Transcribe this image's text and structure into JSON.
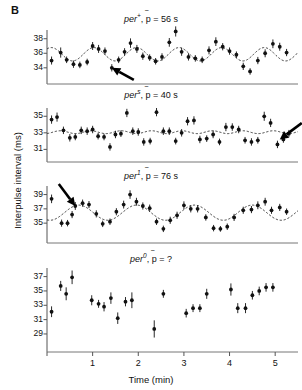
{
  "panel_letter": "B",
  "axes": {
    "ylabel": "Interpulse interval (ms)",
    "xlabel": "Time (min)",
    "xticks": [
      1,
      2,
      3,
      4,
      5
    ],
    "xlim": [
      0,
      5.5
    ]
  },
  "chart_data": {
    "type": "scatter",
    "xlabel": "Time (min)",
    "ylabel": "Interpulse interval (ms)",
    "xlim": [
      0,
      5.5
    ],
    "grid": false,
    "legend": "none",
    "error_bars": "vertical SEM bars on every point",
    "panels": [
      {
        "id": "per-plus",
        "genotype": "per",
        "superscript": "+",
        "period_label": "p̄ = 56 s",
        "period_seconds": 56,
        "title_text": "per+, p̄ = 56 s",
        "fit_curve": "dashed sinusoid",
        "ylim": [
          32.6,
          39.2
        ],
        "yticks": [
          34,
          36,
          38
        ],
        "arrow": {
          "present": true,
          "direction": "up-left",
          "points_to_x": 1.42,
          "points_to_y": 34.0
        },
        "x": [
          0.1,
          0.3,
          0.43,
          0.58,
          0.72,
          0.88,
          1.0,
          1.13,
          1.27,
          1.42,
          1.57,
          1.7,
          1.83,
          1.97,
          2.1,
          2.25,
          2.38,
          2.52,
          2.68,
          2.82,
          2.95,
          3.1,
          3.25,
          3.4,
          3.55,
          3.7,
          3.85,
          4.0,
          4.15,
          4.3,
          4.45,
          4.62,
          4.78,
          4.95,
          5.1,
          5.25
        ],
        "y": [
          35.0,
          36.1,
          35.1,
          34.5,
          34.4,
          34.8,
          37.0,
          36.6,
          36.3,
          34.0,
          35.1,
          36.2,
          37.4,
          36.6,
          35.6,
          35.4,
          34.9,
          35.5,
          37.5,
          39.0,
          36.2,
          35.5,
          35.3,
          35.1,
          36.4,
          37.6,
          36.9,
          36.3,
          35.8,
          34.2,
          33.5,
          35.0,
          36.0,
          37.3,
          36.9,
          36.1
        ],
        "yerr": [
          0.55,
          0.7,
          0.45,
          0.5,
          0.45,
          0.45,
          0.55,
          0.55,
          0.5,
          0.5,
          0.45,
          0.5,
          0.65,
          0.55,
          0.5,
          0.45,
          0.45,
          0.5,
          0.6,
          0.7,
          0.55,
          0.5,
          0.45,
          0.45,
          0.55,
          0.6,
          0.5,
          0.5,
          0.45,
          0.5,
          0.45,
          0.5,
          0.55,
          0.6,
          0.55,
          0.5
        ]
      },
      {
        "id": "per-s",
        "genotype": "per",
        "superscript": "s",
        "period_label": "p̄ = 40 s",
        "period_seconds": 40,
        "title_text": "pers, p̄ = 40 s",
        "fit_curve": "dashed sinusoid",
        "ylim": [
          30.2,
          36.0
        ],
        "yticks": [
          31,
          33,
          35
        ],
        "arrow": {
          "present": true,
          "direction": "down-left",
          "points_to_x": 5.1,
          "points_to_y": 32.2
        },
        "x": [
          0.1,
          0.22,
          0.36,
          0.5,
          0.62,
          0.75,
          0.88,
          1.0,
          1.12,
          1.25,
          1.38,
          1.5,
          1.62,
          1.75,
          1.88,
          2.0,
          2.12,
          2.26,
          2.4,
          2.55,
          2.68,
          2.82,
          2.95,
          3.08,
          3.22,
          3.35,
          3.5,
          3.64,
          3.78,
          3.92,
          4.06,
          4.2,
          4.34,
          4.48,
          4.62,
          4.76,
          4.9,
          5.05,
          5.18,
          5.3
        ],
        "y": [
          34.6,
          34.9,
          33.3,
          32.4,
          32.5,
          33.3,
          33.2,
          33.4,
          32.6,
          32.5,
          31.3,
          32.8,
          32.9,
          35.4,
          33.2,
          33.1,
          31.9,
          32.0,
          35.5,
          33.2,
          33.2,
          32.0,
          33.0,
          34.4,
          34.5,
          32.2,
          32.3,
          32.8,
          31.9,
          33.7,
          33.7,
          33.4,
          32.1,
          31.9,
          32.1,
          35.0,
          34.2,
          31.6,
          32.2,
          32.9
        ],
        "yerr": [
          0.5,
          0.55,
          0.45,
          0.45,
          0.4,
          0.45,
          0.45,
          0.45,
          0.4,
          0.4,
          0.45,
          0.45,
          0.4,
          0.5,
          0.45,
          0.45,
          0.45,
          0.4,
          0.5,
          0.45,
          0.45,
          0.4,
          0.45,
          0.5,
          0.5,
          0.45,
          0.4,
          0.45,
          0.4,
          0.5,
          0.45,
          0.45,
          0.4,
          0.45,
          0.4,
          0.55,
          0.5,
          0.45,
          0.4,
          0.45
        ]
      },
      {
        "id": "per-1",
        "genotype": "per",
        "superscript": "1",
        "period_label": "p̄ = 76 s",
        "period_seconds": 76,
        "title_text": "per1, p̄ = 76 s",
        "fit_curve": "dashed sinusoid",
        "ylim": [
          33.2,
          40.2
        ],
        "yticks": [
          35,
          37,
          39
        ],
        "arrow": {
          "present": true,
          "direction": "down-right",
          "points_to_x": 0.62,
          "points_to_y": 37.4
        },
        "x": [
          0.1,
          0.32,
          0.45,
          0.55,
          0.62,
          0.78,
          0.92,
          1.08,
          1.22,
          1.38,
          1.52,
          1.68,
          1.82,
          1.96,
          2.1,
          2.25,
          2.4,
          2.55,
          2.7,
          2.85,
          3.0,
          3.15,
          3.3,
          3.48,
          3.65,
          3.8,
          3.95,
          4.1,
          4.3,
          4.48,
          4.62,
          4.78,
          4.92,
          5.1,
          5.25
        ],
        "y": [
          38.4,
          35.0,
          35.0,
          36.2,
          37.4,
          37.8,
          37.6,
          36.3,
          34.9,
          35.2,
          36.6,
          37.6,
          39.0,
          38.0,
          37.4,
          37.1,
          35.2,
          34.2,
          35.4,
          36.1,
          37.5,
          37.0,
          37.0,
          35.8,
          34.3,
          34.2,
          34.5,
          35.8,
          36.8,
          36.9,
          37.5,
          38.0,
          36.8,
          37.2,
          36.6
        ],
        "yerr": [
          0.6,
          0.5,
          0.45,
          0.5,
          0.55,
          0.5,
          0.5,
          0.5,
          0.45,
          0.45,
          0.5,
          0.55,
          0.6,
          0.55,
          0.5,
          0.5,
          0.45,
          0.45,
          0.5,
          0.5,
          0.55,
          0.5,
          0.5,
          0.45,
          0.45,
          0.4,
          0.45,
          0.5,
          0.5,
          0.5,
          0.55,
          0.55,
          0.5,
          0.5,
          0.45
        ]
      },
      {
        "id": "per-0",
        "genotype": "per",
        "superscript": "0",
        "period_label": "p̄ = ?",
        "period_seconds": null,
        "title_text": "per0, p̄ = ?",
        "fit_curve": "none",
        "ylim": [
          27.6,
          38.2
        ],
        "yticks": [
          29,
          31,
          33,
          35,
          37
        ],
        "arrow": {
          "present": false
        },
        "x": [
          0.1,
          0.3,
          0.42,
          0.55,
          0.98,
          1.13,
          1.25,
          1.4,
          1.55,
          1.72,
          1.86,
          2.35,
          2.55,
          3.05,
          3.2,
          3.35,
          3.5,
          4.03,
          4.18,
          4.35,
          4.5,
          4.65,
          4.8,
          4.95
        ],
        "y": [
          32.1,
          35.7,
          34.6,
          36.9,
          33.7,
          33.2,
          32.8,
          34.0,
          31.2,
          33.5,
          33.7,
          29.7,
          34.6,
          31.9,
          32.6,
          32.6,
          34.6,
          35.2,
          32.6,
          32.6,
          34.4,
          35.0,
          35.5,
          35.5
        ],
        "yerr": [
          0.75,
          0.7,
          0.9,
          0.95,
          0.7,
          0.55,
          0.65,
          0.8,
          0.8,
          0.65,
          1.1,
          1.2,
          0.55,
          0.6,
          0.55,
          0.55,
          0.7,
          0.85,
          0.7,
          0.7,
          0.6,
          0.6,
          0.6,
          0.6
        ]
      }
    ]
  }
}
